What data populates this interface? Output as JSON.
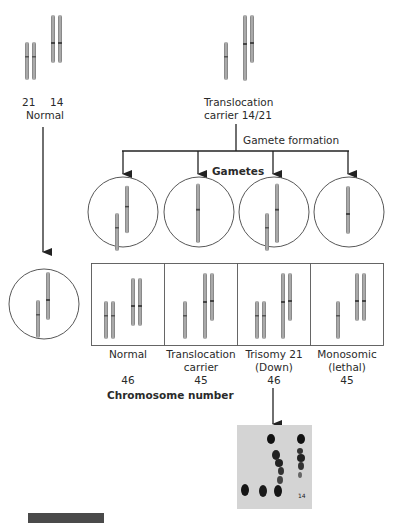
{
  "top": {
    "normal_parent": {
      "label_21": "21",
      "label_14": "14",
      "caption": "Normal"
    },
    "carrier_parent": {
      "caption_line1": "Translocation",
      "caption_line2": "carrier 14/21"
    }
  },
  "process": {
    "gamete_formation": "Gamete formation",
    "gametes_heading": "Gametes"
  },
  "gametes": [
    {
      "contents": "21 + t(14;21)"
    },
    {
      "contents": "t(14;21)"
    },
    {
      "contents": "21 + t(14;21)"
    },
    {
      "contents": "14 only"
    }
  ],
  "offspring": [
    {
      "name_line1": "Normal",
      "name_line2": "",
      "chromosome_number": "46"
    },
    {
      "name_line1": "Translocation",
      "name_line2": "carrier",
      "chromosome_number": "45"
    },
    {
      "name_line1": "Trisomy 21",
      "name_line2": "(Down)",
      "chromosome_number": "46"
    },
    {
      "name_line1": "Monosomic",
      "name_line2": "(lethal)",
      "chromosome_number": "45"
    }
  ],
  "legend": {
    "chromosome_number_label": "Chromosome number"
  },
  "karyotype_photo": {
    "label": "14"
  },
  "colors": {
    "chromosome": "#9a9a9a",
    "chromosome_dark": "#6e6e6e",
    "line": "#222222",
    "photo_bg": "#d4d4d4"
  }
}
